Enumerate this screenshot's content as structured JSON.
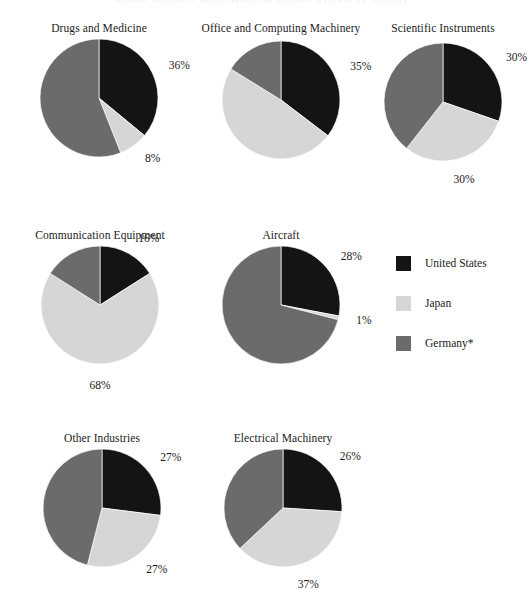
{
  "figure": {
    "cut_off_header": "Figure: Shares of World High-Technology Exports by Industry",
    "width": 524,
    "height": 586
  },
  "legend": {
    "entries": [
      {
        "label": "United States",
        "color": "#141414",
        "key": "united_states"
      },
      {
        "label": "Japan",
        "color": "#d6d6d6",
        "key": "japan"
      },
      {
        "label": "Germany*",
        "color": "#6b6b6b",
        "key": "germany"
      }
    ]
  },
  "chart_data": {
    "type": "pie",
    "title": "Shares of World High-Technology Exports by Industry",
    "legend_position": "right-middle",
    "series_names": [
      "United States",
      "Japan",
      "Germany*"
    ],
    "series_colors": [
      "#141414",
      "#d6d6d6",
      "#6b6b6b"
    ],
    "value_suffix": "%",
    "charts": [
      {
        "title": "Drugs and Medicine",
        "categories": [
          "United States",
          "Japan",
          "Germany*"
        ],
        "values": [
          36,
          8,
          56
        ],
        "labels": [
          "36%",
          "8%",
          "56%"
        ],
        "start_angle_deg": 0,
        "row": 0,
        "col": 0
      },
      {
        "title": "Office and Computing Machinery",
        "categories": [
          "United States",
          "Japan",
          "Germany*"
        ],
        "values": [
          35,
          48,
          16
        ],
        "labels": [
          "35%",
          "48%",
          "16%"
        ],
        "start_angle_deg": 0,
        "row": 0,
        "col": 1
      },
      {
        "title": "Scientific Instruments",
        "categories": [
          "United States",
          "Japan",
          "Germany*"
        ],
        "values": [
          30,
          30,
          39
        ],
        "labels": [
          "30%",
          "30%",
          "39%"
        ],
        "start_angle_deg": 0,
        "row": 0,
        "col": 2
      },
      {
        "title": "Communication Equipment",
        "categories": [
          "United States",
          "Japan",
          "Germany*"
        ],
        "values": [
          16,
          68,
          16
        ],
        "labels": [
          "16%",
          "68%",
          "16%"
        ],
        "start_angle_deg": 0,
        "row": 1,
        "col": 0
      },
      {
        "title": "Aircraft",
        "categories": [
          "United States",
          "Japan",
          "Germany*"
        ],
        "values": [
          28,
          1,
          71
        ],
        "labels": [
          "28%",
          "1%",
          "71%"
        ],
        "start_angle_deg": 0,
        "row": 1,
        "col": 1
      },
      {
        "title": "Other Industries",
        "categories": [
          "United States",
          "Japan",
          "Germany*"
        ],
        "values": [
          27,
          27,
          46
        ],
        "labels": [
          "27%",
          "27%",
          "46%"
        ],
        "start_angle_deg": 0,
        "row": 2,
        "col": 0
      },
      {
        "title": "Electrical Machinery",
        "categories": [
          "United States",
          "Japan",
          "Germany*"
        ],
        "values": [
          26,
          37,
          37
        ],
        "labels": [
          "26%",
          "37%",
          "37%"
        ],
        "start_angle_deg": 0,
        "row": 2,
        "col": 1
      }
    ]
  },
  "layout": {
    "pie_radius": 59,
    "label_offset": 16,
    "panels": [
      {
        "cx": 99,
        "cy": 98,
        "title_y": 22
      },
      {
        "cx": 281,
        "cy": 100,
        "title_y": 22
      },
      {
        "cx": 443,
        "cy": 102,
        "title_y": 22
      },
      {
        "cx": 100,
        "cy": 305,
        "title_y": 229
      },
      {
        "cx": 281,
        "cy": 305,
        "title_y": 229
      },
      {
        "cx": 102,
        "cy": 508,
        "title_y": 432
      },
      {
        "cx": 283,
        "cy": 508,
        "title_y": 432
      }
    ]
  }
}
